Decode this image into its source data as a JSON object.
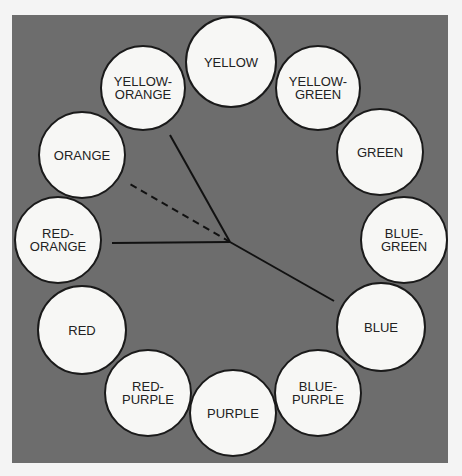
{
  "diagram": {
    "type": "color-wheel",
    "background_color": "#6d6d6d",
    "circle_fill": "#f7f7f5",
    "circles": [
      {
        "label": "YELLOW",
        "cx": 231,
        "cy": 62,
        "r": 46
      },
      {
        "label": "YELLOW-\nGREEN",
        "cx": 318,
        "cy": 88,
        "r": 43
      },
      {
        "label": "GREEN",
        "cx": 380,
        "cy": 152,
        "r": 44
      },
      {
        "label": "BLUE-\nGREEN",
        "cx": 404,
        "cy": 240,
        "r": 44
      },
      {
        "label": "BLUE",
        "cx": 381,
        "cy": 327,
        "r": 45
      },
      {
        "label": "BLUE-\nPURPLE",
        "cx": 318,
        "cy": 393,
        "r": 44
      },
      {
        "label": "PURPLE",
        "cx": 233,
        "cy": 413,
        "r": 44
      },
      {
        "label": "RED-\nPURPLE",
        "cx": 148,
        "cy": 393,
        "r": 44
      },
      {
        "label": "RED",
        "cx": 82,
        "cy": 330,
        "r": 45
      },
      {
        "label": "RED-\nORANGE",
        "cx": 58,
        "cy": 240,
        "r": 44
      },
      {
        "label": "ORANGE",
        "cx": 82,
        "cy": 155,
        "r": 44
      },
      {
        "label": "YELLOW-\nORANGE",
        "cx": 143,
        "cy": 88,
        "r": 43
      }
    ],
    "connector_lines": [
      {
        "from": "center",
        "to": "YELLOW-ORANGE",
        "x1": 230,
        "y1": 242,
        "x2": 170,
        "y2": 135,
        "style": "solid"
      },
      {
        "from": "center",
        "to": "ORANGE",
        "x1": 230,
        "y1": 242,
        "x2": 130,
        "y2": 184,
        "style": "dashed"
      },
      {
        "from": "center",
        "to": "RED-ORANGE",
        "x1": 230,
        "y1": 242,
        "x2": 112,
        "y2": 243,
        "style": "solid"
      },
      {
        "from": "center",
        "to": "BLUE",
        "x1": 230,
        "y1": 242,
        "x2": 334,
        "y2": 301,
        "style": "solid"
      }
    ]
  }
}
